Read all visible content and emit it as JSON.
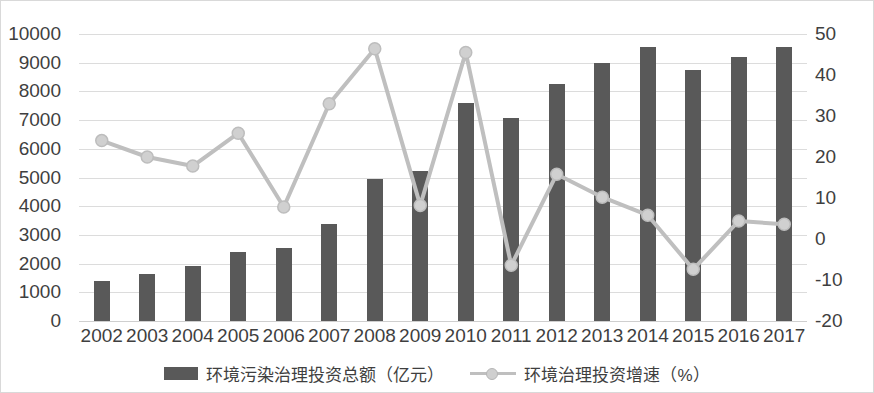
{
  "chart_data": {
    "type": "bar",
    "title": "",
    "xlabel": "",
    "ylabel": "",
    "y2label": "",
    "grid": true,
    "legend_position": "bottom",
    "categories": [
      "2002",
      "2003",
      "2004",
      "2005",
      "2006",
      "2007",
      "2008",
      "2009",
      "2010",
      "2011",
      "2012",
      "2013",
      "2014",
      "2015",
      "2016",
      "2017"
    ],
    "ylim": [
      0,
      10000
    ],
    "yticks": [
      0,
      1000,
      2000,
      3000,
      4000,
      5000,
      6000,
      7000,
      8000,
      9000,
      10000
    ],
    "y2lim": [
      -20,
      50
    ],
    "y2ticks": [
      -20,
      -10,
      0,
      10,
      20,
      30,
      40,
      50
    ],
    "series": [
      {
        "name": "环境污染治理投资总额（亿元）",
        "type": "bar",
        "axis": "left",
        "color": "#595959",
        "values": [
          1400,
          1650,
          1900,
          2400,
          2560,
          3390,
          4940,
          5230,
          7580,
          7080,
          8250,
          9000,
          9550,
          8750,
          9200,
          9540
        ]
      },
      {
        "name": "环境治理投资增速（%）",
        "type": "line",
        "axis": "right",
        "color": "#bfbfbf",
        "values": [
          24.0,
          20.0,
          17.8,
          25.8,
          7.8,
          33.0,
          46.4,
          8.2,
          45.5,
          -6.4,
          15.8,
          10.2,
          5.8,
          -7.4,
          4.4,
          3.6
        ]
      }
    ]
  },
  "legend": {
    "items": [
      {
        "label": "环境污染治理投资总额（亿元）",
        "marker": "bar-swatch"
      },
      {
        "label": "环境治理投资增速（%）",
        "marker": "line-marker-swatch"
      }
    ]
  }
}
